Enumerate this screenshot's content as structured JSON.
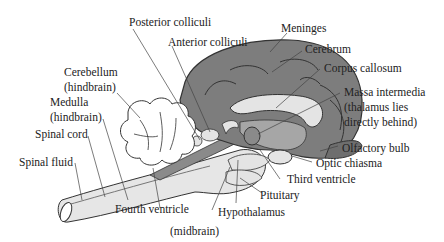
{
  "diagram": {
    "colors": {
      "brain_dark": "#7d7d7d",
      "brain_mid": "#a6a6a6",
      "brain_light": "#e4e4e4",
      "outline": "#333333",
      "leader": "#444444"
    },
    "labels": {
      "posterior_colliculi": "Posterior colliculi",
      "anterior_colliculi": "Anterior colliculi",
      "meninges": "Meninges",
      "cerebrum": "Cerebrum",
      "corpus_callosum": "Corpus callosum",
      "massa_line1": "Massa intermedia",
      "massa_line2": "(thalamus lies",
      "massa_line3": "directly behind)",
      "cerebellum_line1": "Cerebellum",
      "cerebellum_line2": "(hindbrain)",
      "medulla_line1": "Medulla",
      "medulla_line2": "(hindbrain)",
      "spinal_cord": "Spinal cord",
      "spinal_fluid": "Spinal fluid",
      "olfactory_bulb": "Olfactory bulb",
      "optic_chiasma": "Optic chiasma",
      "third_ventricle": "Third ventricle",
      "fourth_ventricle": "Fourth ventricle",
      "pituitary": "Pituitary",
      "hypothalamus": "Hypothalamus",
      "midbrain": "(midbrain)"
    }
  }
}
